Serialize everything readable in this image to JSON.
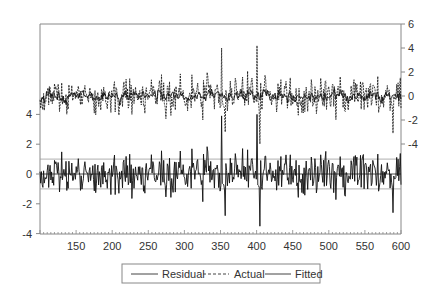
{
  "chart_data": {
    "type": "line",
    "title": "",
    "xlabel": "",
    "x_range": [
      100,
      600
    ],
    "x_ticks": [
      150,
      200,
      250,
      300,
      350,
      400,
      450,
      500,
      550,
      600
    ],
    "left_axis": {
      "label": "",
      "applies_to": "Residual",
      "ticks": [
        4,
        2,
        0,
        -2,
        -4
      ],
      "ylim": [
        -4,
        6
      ]
    },
    "right_axis": {
      "label": "",
      "applies_to": [
        "Actual",
        "Fitted"
      ],
      "ticks": [
        6,
        4,
        2,
        0,
        -2,
        -4
      ],
      "ylim": [
        -4,
        6
      ]
    },
    "reference_lines": {
      "residual_zero": 0,
      "residual_plus_sd": 1,
      "residual_minus_sd": -1
    },
    "legend": {
      "position": "bottom-center",
      "entries": [
        {
          "name": "Residual",
          "style": "solid"
        },
        {
          "name": "Actual",
          "style": "dashed"
        },
        {
          "name": "Fitted",
          "style": "solid"
        }
      ]
    },
    "series": [
      {
        "name": "Residual",
        "axis": "left",
        "typical_range": [
          -2.2,
          2.2
        ],
        "mean": 0,
        "notable_points": [
          {
            "x": 352,
            "y": 3.9
          },
          {
            "x": 357,
            "y": -2.8
          },
          {
            "x": 401,
            "y": 4.0
          },
          {
            "x": 405,
            "y": -3.5
          },
          {
            "x": 589,
            "y": -2.6
          }
        ]
      },
      {
        "name": "Actual",
        "axis": "right",
        "typical_range": [
          -3,
          2.3
        ],
        "mean": 0,
        "notable_points": [
          {
            "x": 352,
            "y": 4.0
          },
          {
            "x": 357,
            "y": -3.0
          },
          {
            "x": 401,
            "y": 4.2
          },
          {
            "x": 405,
            "y": -4.0
          },
          {
            "x": 589,
            "y": -3.1
          }
        ]
      },
      {
        "name": "Fitted",
        "axis": "right",
        "typical_range": [
          -0.8,
          0.8
        ],
        "mean": 0
      }
    ],
    "seed": 20240517,
    "n_points": 500
  },
  "legend": {
    "residual_label": "Residual",
    "actual_label": "Actual",
    "fitted_label": "Fitted"
  },
  "colors": {
    "line": "#111111",
    "axis": "#888888",
    "ref_line": "#9a9a9a",
    "zero_line": "#333333"
  }
}
